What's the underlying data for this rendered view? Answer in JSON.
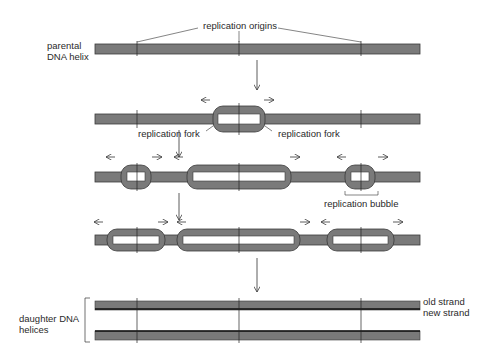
{
  "labels": {
    "replication_origins": "replication origins",
    "parental_line1": "parental",
    "parental_line2": "DNA helix",
    "fork_left": "replication fork",
    "fork_right": "replication fork",
    "bubble": "replication bubble",
    "daughter_line1": "daughter DNA",
    "daughter_line2": "helices",
    "old_strand": "old strand",
    "new_strand": "new strand"
  },
  "colors": {
    "helix": "#7a7a7a",
    "outline": "#3a3a3a",
    "background": "#ffffff"
  },
  "stages": [
    {
      "name": "parental DNA helix",
      "y": 49
    },
    {
      "name": "first replication bubble",
      "y": 119
    },
    {
      "name": "three bubbles",
      "y": 177
    },
    {
      "name": "bubbles nearly merged",
      "y": 240
    },
    {
      "name": "daughter helices",
      "y": [
        305,
        335
      ]
    }
  ],
  "origins_x": [
    137,
    239,
    361
  ]
}
